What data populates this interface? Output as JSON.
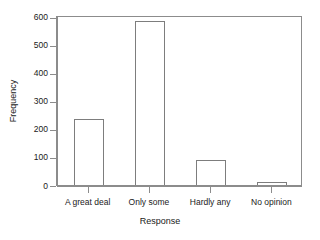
{
  "chart_data": {
    "type": "bar",
    "title": "",
    "subtitle": "",
    "xlabel": "Response",
    "ylabel": "Frequency",
    "categories": [
      "A great deal",
      "Only some",
      "Hardly any",
      "No opinion"
    ],
    "values": [
      236,
      584,
      89,
      10
    ],
    "ylim": [
      0,
      600
    ],
    "yticks": [
      0,
      100,
      200,
      300,
      400,
      500,
      600
    ],
    "ytick_labels": [
      "0",
      "100",
      "200",
      "300",
      "400",
      "500",
      "600"
    ],
    "grid": false,
    "legend": null,
    "bar_fill_color": "#ffffff",
    "bar_border_color": "#7d7d7d",
    "axis_color": "#8c8c8c",
    "background_color": "#ffffff"
  },
  "axes": {
    "y_title": "Frequency",
    "x_title": "Response"
  }
}
